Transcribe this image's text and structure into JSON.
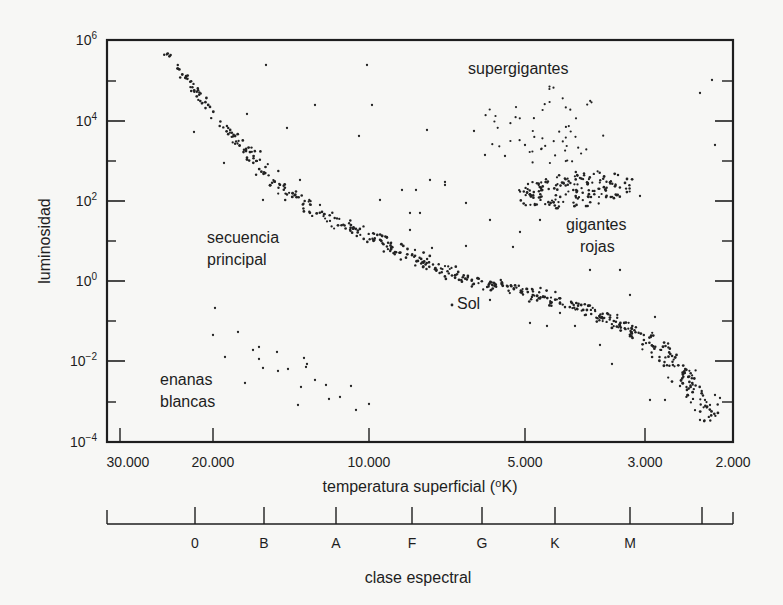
{
  "chart_data": {
    "type": "scatter",
    "title": "",
    "xlabel": "temperatura superficial (⁰K)",
    "ylabel": "luminosidad",
    "x_scale": "log (reversed)",
    "y_scale": "log",
    "xlim": [
      30000,
      2000
    ],
    "ylim": [
      "10^-4",
      "10^6"
    ],
    "grid": false,
    "legend": null,
    "x_ticks": [
      {
        "label": "30.000",
        "value": 30000,
        "px": 120
      },
      {
        "label": "20.000",
        "value": 20000,
        "px": 213
      },
      {
        "label": "10.000",
        "value": 10000,
        "px": 369
      },
      {
        "label": "5.000",
        "value": 5000,
        "px": 525
      },
      {
        "label": "3.000",
        "value": 3000,
        "px": 645
      },
      {
        "label": "2.000",
        "value": 2000,
        "px": 733
      }
    ],
    "y_ticks": [
      {
        "base": "10",
        "exp": "6",
        "value": 1000000,
        "px": 40
      },
      {
        "base": "10",
        "exp": "4",
        "value": 10000,
        "px": 121
      },
      {
        "base": "10",
        "exp": "2",
        "value": 100,
        "px": 201
      },
      {
        "base": "10",
        "exp": "0",
        "value": 1,
        "px": 281
      },
      {
        "base": "10",
        "exp": "-2",
        "value": 0.01,
        "px": 361
      },
      {
        "base": "10",
        "exp": "-4",
        "value": 0.0001,
        "px": 442
      }
    ],
    "y_minor_ticks_px": [
      81,
      161,
      241,
      321,
      402
    ],
    "spectral_axis": {
      "title": "clase espectral",
      "classes": [
        {
          "label": "0",
          "px": 195
        },
        {
          "label": "B",
          "px": 264
        },
        {
          "label": "A",
          "px": 336
        },
        {
          "label": "F",
          "px": 412
        },
        {
          "label": "G",
          "px": 482
        },
        {
          "label": "K",
          "px": 555
        },
        {
          "label": "M",
          "px": 630
        },
        {
          "label": "",
          "px": 702
        }
      ]
    },
    "annotations": [
      {
        "text": "supergigantes",
        "x": 468,
        "y": 74
      },
      {
        "text": "secuencia",
        "x": 207,
        "y": 243
      },
      {
        "text": "principal",
        "x": 207,
        "y": 265
      },
      {
        "text": "gigantes",
        "x": 566,
        "y": 230
      },
      {
        "text": "rojas",
        "x": 580,
        "y": 252
      },
      {
        "text": "Sol",
        "x": 457,
        "y": 309
      },
      {
        "text": "enanas",
        "x": 160,
        "y": 385
      },
      {
        "text": "blancas",
        "x": 160,
        "y": 407
      }
    ],
    "series": [
      {
        "name": "secuencia principal",
        "approx_range": "T 30.000–2.200 K, L 10^6–10^-4 (diagonal band)"
      },
      {
        "name": "gigantes rojas",
        "approx_range": "T ~5.000–3.000 K, L ~10^1–10^3"
      },
      {
        "name": "supergigantes",
        "approx_range": "T ~7.000–3.000 K, L ~10^3–10^5.5"
      },
      {
        "name": "enanas blancas",
        "approx_range": "T ~20.000–8.000 K, L ~10^-1–10^-3.5"
      },
      {
        "name": "Sol",
        "point": {
          "T": 5800,
          "L": 1
        }
      }
    ],
    "sun_marker": {
      "px": 452,
      "py": 305
    }
  },
  "render": {
    "frame": {
      "left": 107,
      "top": 40,
      "right": 733,
      "bottom": 442
    },
    "regions": {
      "main_sequence": {
        "path": [
          [
            161,
            46
          ],
          [
            200,
            97
          ],
          [
            240,
            145
          ],
          [
            280,
            185
          ],
          [
            320,
            213
          ],
          [
            360,
            232
          ],
          [
            400,
            253
          ],
          [
            440,
            270
          ],
          [
            480,
            282
          ],
          [
            520,
            291
          ],
          [
            560,
            303
          ],
          [
            600,
            316
          ],
          [
            640,
            335
          ],
          [
            670,
            356
          ],
          [
            690,
            385
          ],
          [
            705,
            410
          ],
          [
            712,
            420
          ]
        ],
        "count": 560,
        "spread": 6.5,
        "seed": 7
      },
      "giants": {
        "cx": 575,
        "cy": 190,
        "rx": 60,
        "ry": 18,
        "count": 170,
        "seed": 21
      },
      "supergiants": {
        "cx": 545,
        "cy": 125,
        "rx": 65,
        "ry": 40,
        "count": 55,
        "seed": 33
      },
      "white_dwarfs": {
        "cx": 270,
        "cy": 370,
        "rx": 80,
        "ry": 40,
        "count": 0,
        "seed": 44
      }
    },
    "sparse_points": [
      [
        266,
        65
      ],
      [
        367,
        65
      ],
      [
        315,
        105
      ],
      [
        372,
        105
      ],
      [
        287,
        128
      ],
      [
        359,
        136
      ],
      [
        224,
        163
      ],
      [
        427,
        130
      ],
      [
        474,
        131
      ],
      [
        505,
        156
      ],
      [
        525,
        145
      ],
      [
        430,
        180
      ],
      [
        445,
        185
      ],
      [
        402,
        190
      ],
      [
        416,
        190
      ],
      [
        410,
        213
      ],
      [
        420,
        213
      ],
      [
        445,
        182
      ],
      [
        247,
        114
      ],
      [
        194,
        132
      ],
      [
        300,
        180
      ],
      [
        320,
        205
      ],
      [
        263,
        200
      ],
      [
        380,
        200
      ],
      [
        466,
        203
      ],
      [
        490,
        220
      ],
      [
        520,
        232
      ],
      [
        540,
        220
      ],
      [
        608,
        228
      ],
      [
        590,
        270
      ],
      [
        620,
        270
      ],
      [
        630,
        295
      ],
      [
        655,
        317
      ],
      [
        432,
        248
      ],
      [
        410,
        230
      ],
      [
        490,
        300
      ],
      [
        530,
        323
      ],
      [
        547,
        326
      ],
      [
        560,
        313
      ],
      [
        575,
        326
      ],
      [
        595,
        310
      ],
      [
        600,
        345
      ],
      [
        612,
        364
      ],
      [
        650,
        400
      ],
      [
        665,
        400
      ],
      [
        700,
        420
      ],
      [
        705,
        400
      ],
      [
        710,
        405
      ],
      [
        715,
        395
      ],
      [
        720,
        398
      ],
      [
        712,
        80
      ],
      [
        700,
        93
      ],
      [
        715,
        145
      ],
      [
        640,
        196
      ],
      [
        485,
        155
      ],
      [
        466,
        246
      ],
      [
        415,
        250
      ],
      [
        513,
        247
      ],
      [
        215,
        308
      ],
      [
        213,
        335
      ],
      [
        238,
        332
      ],
      [
        253,
        350
      ],
      [
        259,
        347
      ],
      [
        277,
        352
      ],
      [
        259,
        359
      ],
      [
        263,
        368
      ],
      [
        278,
        371
      ],
      [
        288,
        369
      ],
      [
        304,
        358
      ],
      [
        307,
        364
      ],
      [
        306,
        367
      ],
      [
        245,
        383
      ],
      [
        301,
        387
      ],
      [
        315,
        380
      ],
      [
        326,
        385
      ],
      [
        298,
        405
      ],
      [
        329,
        399
      ],
      [
        340,
        397
      ],
      [
        351,
        386
      ],
      [
        356,
        410
      ],
      [
        369,
        404
      ],
      [
        225,
        357
      ]
    ],
    "colors": {
      "background": "#f7f7f5",
      "ink": "#1e1e1e",
      "dots": "#222222"
    }
  }
}
